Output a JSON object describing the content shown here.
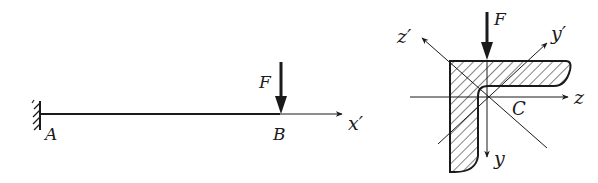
{
  "figure": {
    "background": "#ffffff",
    "ink": "#1a1a1a"
  },
  "left_diagram": {
    "title": "cantilever beam",
    "support_label": "A",
    "load_point_label": "B",
    "force_label": "F",
    "axis_label": "x′"
  },
  "right_diagram": {
    "title": "angle cross-section",
    "force_label": "F",
    "centroid_label": "C",
    "axes": {
      "z": "z",
      "y": "y",
      "z_prime": "z′",
      "y_prime": "y′"
    }
  }
}
